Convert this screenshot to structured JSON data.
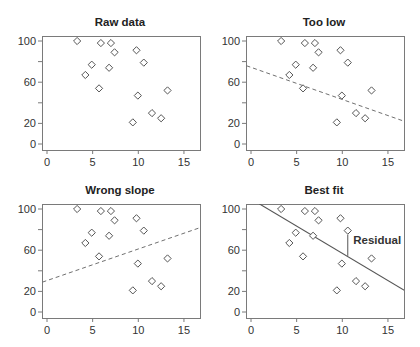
{
  "figure": {
    "panel_layout": [
      {
        "ox": 0,
        "oy": 0
      },
      {
        "ox": 204,
        "oy": 0
      },
      {
        "ox": 0,
        "oy": 168
      },
      {
        "ox": 204,
        "oy": 168
      }
    ],
    "colors": {
      "axis": "#7a7a7a",
      "marker": "#555555",
      "dashed_line": "#707070",
      "fit_line": "#555555",
      "text": "#333333"
    }
  },
  "chart_data": [
    {
      "type": "scatter",
      "title": "Raw data",
      "xlabel": "",
      "ylabel": "",
      "xlim": [
        -0.5,
        16.8
      ],
      "ylim": [
        -5,
        105
      ],
      "xticks": [
        0,
        5,
        10,
        15
      ],
      "yticks": [
        0,
        20,
        40,
        60,
        80,
        100
      ],
      "ytick_labels": [
        "0",
        "20",
        "",
        "60",
        "",
        "100"
      ],
      "grid": false,
      "points": [
        [
          3.3,
          100
        ],
        [
          4.2,
          67
        ],
        [
          4.9,
          77
        ],
        [
          5.7,
          54
        ],
        [
          5.9,
          98
        ],
        [
          6.8,
          74
        ],
        [
          7.0,
          98
        ],
        [
          7.4,
          89
        ],
        [
          9.4,
          21
        ],
        [
          9.8,
          91
        ],
        [
          9.95,
          47
        ],
        [
          10.6,
          79
        ],
        [
          11.5,
          30
        ],
        [
          12.5,
          25
        ],
        [
          13.2,
          52
        ]
      ],
      "line": null,
      "annotations": []
    },
    {
      "type": "scatter",
      "title": "Too low",
      "xlabel": "",
      "ylabel": "",
      "xlim": [
        -0.5,
        16.8
      ],
      "ylim": [
        -5,
        105
      ],
      "xticks": [
        0,
        5,
        10,
        15
      ],
      "yticks": [
        0,
        20,
        40,
        60,
        80,
        100
      ],
      "ytick_labels": [
        "0",
        "20",
        "",
        "60",
        "",
        "100"
      ],
      "grid": false,
      "points": [
        [
          3.3,
          100
        ],
        [
          4.2,
          67
        ],
        [
          4.9,
          77
        ],
        [
          5.7,
          54
        ],
        [
          5.9,
          98
        ],
        [
          6.8,
          74
        ],
        [
          7.0,
          98
        ],
        [
          7.4,
          89
        ],
        [
          9.4,
          21
        ],
        [
          9.8,
          91
        ],
        [
          9.95,
          47
        ],
        [
          10.6,
          79
        ],
        [
          11.5,
          30
        ],
        [
          12.5,
          25
        ],
        [
          13.2,
          52
        ]
      ],
      "line": {
        "style": "dashed",
        "x": [
          -0.5,
          16.8
        ],
        "y": [
          76,
          22
        ]
      },
      "annotations": []
    },
    {
      "type": "scatter",
      "title": "Wrong slope",
      "xlabel": "",
      "ylabel": "",
      "xlim": [
        -0.5,
        16.8
      ],
      "ylim": [
        -5,
        105
      ],
      "xticks": [
        0,
        5,
        10,
        15
      ],
      "yticks": [
        0,
        20,
        40,
        60,
        80,
        100
      ],
      "ytick_labels": [
        "0",
        "20",
        "",
        "60",
        "",
        "100"
      ],
      "grid": false,
      "points": [
        [
          3.3,
          100
        ],
        [
          4.2,
          67
        ],
        [
          4.9,
          77
        ],
        [
          5.7,
          54
        ],
        [
          5.9,
          98
        ],
        [
          6.8,
          74
        ],
        [
          7.0,
          98
        ],
        [
          7.4,
          89
        ],
        [
          9.4,
          21
        ],
        [
          9.8,
          91
        ],
        [
          9.95,
          47
        ],
        [
          10.6,
          79
        ],
        [
          11.5,
          30
        ],
        [
          12.5,
          25
        ],
        [
          13.2,
          52
        ]
      ],
      "line": {
        "style": "dashed",
        "x": [
          -0.5,
          16.8
        ],
        "y": [
          29,
          82
        ]
      },
      "annotations": []
    },
    {
      "type": "scatter",
      "title": "Best fit",
      "xlabel": "",
      "ylabel": "",
      "xlim": [
        -0.5,
        16.8
      ],
      "ylim": [
        -5,
        105
      ],
      "xticks": [
        0,
        5,
        10,
        15
      ],
      "yticks": [
        0,
        20,
        40,
        60,
        80,
        100
      ],
      "ytick_labels": [
        "0",
        "20",
        "",
        "60",
        "",
        "100"
      ],
      "grid": false,
      "points": [
        [
          3.3,
          100
        ],
        [
          4.2,
          67
        ],
        [
          4.9,
          77
        ],
        [
          5.7,
          54
        ],
        [
          5.9,
          98
        ],
        [
          6.8,
          74
        ],
        [
          7.0,
          98
        ],
        [
          7.4,
          89
        ],
        [
          9.4,
          21
        ],
        [
          9.8,
          91
        ],
        [
          9.95,
          47
        ],
        [
          10.6,
          79
        ],
        [
          11.5,
          30
        ],
        [
          12.5,
          25
        ],
        [
          13.2,
          52
        ]
      ],
      "line": {
        "style": "solid",
        "x": [
          0.9,
          16.8
        ],
        "y": [
          105,
          21
        ]
      },
      "annotations": [
        {
          "type": "residual",
          "x": 10.6,
          "y_from": 79,
          "y_to": 54.5
        },
        {
          "type": "text",
          "text": "Residual",
          "x": 11.2,
          "y": 66
        }
      ]
    }
  ]
}
